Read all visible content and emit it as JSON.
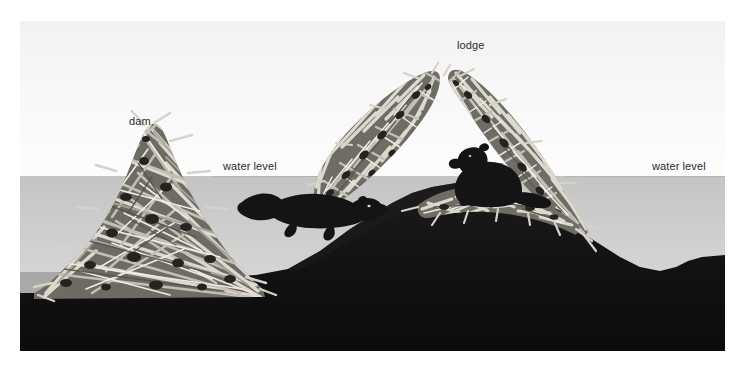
{
  "figure": {
    "labels": {
      "dam": "dam",
      "lodge": "lodge",
      "water_level_left": "water level",
      "water_level_right": "water level"
    },
    "icons": {
      "beaver_swimming": "beaver-swimming-icon",
      "beaver_lodge": "beaver-sitting-icon",
      "dam_structure": "stick-dam-icon",
      "lodge_structure": "stick-lodge-icon"
    },
    "colors": {
      "sky": "#f7f7f7",
      "water": "#cfcfcf",
      "downstream_water": "#ababab",
      "ground": "#121212",
      "sticks_light": "#d8d5cd",
      "sticks_mid": "#9c9890",
      "sticks_dark": "#5d5a54",
      "label_text": "#2b2b2b",
      "water_line": "#b4b4b4",
      "page_background": "#ffffff"
    },
    "geometry": {
      "plate_left": 20,
      "plate_top": 21,
      "plate_width": 705,
      "plate_height": 330,
      "water_level_y": 155,
      "downstream_water_level_y": 251
    }
  }
}
